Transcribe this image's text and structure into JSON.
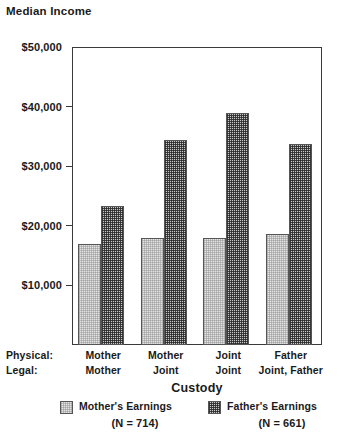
{
  "chart_data": {
    "type": "bar",
    "title": "Median Income",
    "xlabel": "Custody",
    "ylabel": "Median Income",
    "ylim": [
      0,
      50000
    ],
    "grid": false,
    "legend_position": "bottom",
    "categories": [
      "Mother\nMother",
      "Mother\nJoint",
      "Joint\nJoint",
      "Father\nJoint, Father"
    ],
    "category_rows": {
      "physical_label": "Physical:",
      "legal_label": "Legal:",
      "physical": [
        "Mother",
        "Mother",
        "Joint",
        "Father"
      ],
      "legal": [
        "Mother",
        "Joint",
        "Joint",
        "Joint, Father"
      ]
    },
    "ytick_labels": [
      "$50,000",
      "$40,000",
      "$30,000",
      "$20,000",
      "$10,000"
    ],
    "ytick_values": [
      50000,
      40000,
      30000,
      20000,
      10000
    ],
    "series": [
      {
        "name": "Mother's Earnings",
        "n_label": "(N = 714)",
        "n": 714,
        "values": [
          17000,
          18000,
          18000,
          18700
        ]
      },
      {
        "name": "Father's Earnings",
        "n_label": "(N = 661)",
        "n": 661,
        "values": [
          23400,
          34400,
          39000,
          33700
        ]
      }
    ]
  },
  "colors": {
    "axis": "#3a3a3a",
    "bar_border": "#555555",
    "mother_fill": "#e6e6e6",
    "father_fill": "#c9c9c9",
    "text": "#1a1a1a",
    "background": "#ffffff"
  }
}
